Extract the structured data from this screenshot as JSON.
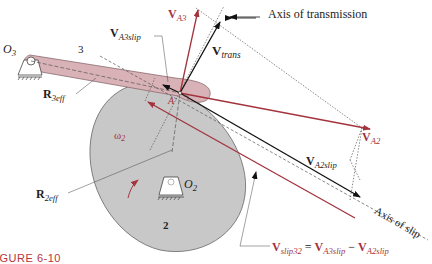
{
  "figure": {
    "caption": "IGURE 6-10",
    "colors": {
      "cam_fill": "#c8c8c8",
      "follower_fill": "#d8b2b6",
      "red_vector": "#a3333d",
      "black_vector": "#111111"
    }
  },
  "labels": {
    "O3": {
      "main": "O",
      "sub": "3"
    },
    "O2": {
      "main": "O",
      "sub": "2"
    },
    "link3": "3",
    "link2": "2",
    "point_A": "A",
    "omega2": {
      "main": "ω",
      "sub": "2"
    },
    "R3eff": {
      "main": "R",
      "sub": "3eff"
    },
    "R2eff": {
      "main": "R",
      "sub": "2eff"
    },
    "VA3": {
      "main": "V",
      "sub": "A3"
    },
    "VA3slip": {
      "main": "V",
      "sub": "A3slip"
    },
    "Vtrans": {
      "main": "V",
      "sub": "trans"
    },
    "VA2": {
      "main": "V",
      "sub": "A2"
    },
    "VA2slip": {
      "main": "V",
      "sub": "A2slip"
    },
    "axis_transmission": "Axis of transmission",
    "axis_slip": "Axis of slip",
    "equation": {
      "lhs_main": "V",
      "lhs_sub": "slip32",
      "eq": "=",
      "t1_main": "V",
      "t1_sub": "A3slip",
      "minus": "−",
      "t2_main": "V",
      "t2_sub": "A2slip"
    }
  }
}
